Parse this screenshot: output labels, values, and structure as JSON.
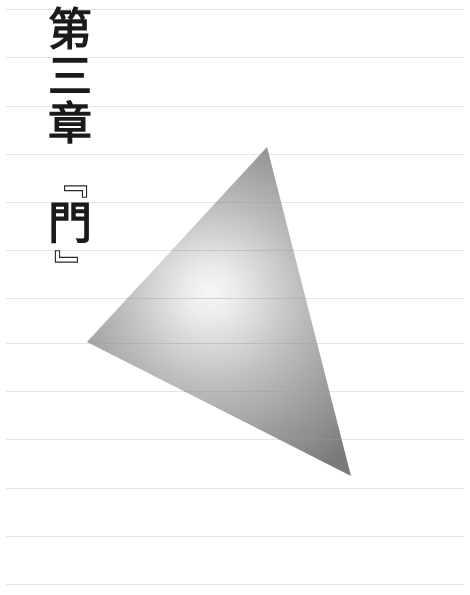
{
  "page": {
    "background": "#ffffff",
    "rule_color": "#e4e4e4",
    "rule_spacing_px": 48.3,
    "rule_positions_y": [
      9,
      57,
      106,
      154,
      202,
      250,
      298,
      343,
      391,
      439,
      488,
      536,
      584
    ]
  },
  "chapter": {
    "number_label": [
      "第",
      "三",
      "章"
    ],
    "open_bracket": "『",
    "title": "門",
    "close_bracket": "』",
    "text_color": "#1a1a1a"
  },
  "illustration": {
    "shape": "triangle",
    "vertices": [
      [
        267,
        147
      ],
      [
        87,
        342
      ],
      [
        351,
        476
      ]
    ],
    "gradient": {
      "type": "radial",
      "center": [
        215,
        300
      ],
      "inner_color": "#f6f6f6",
      "mid_color": "#bdbdbd",
      "outer_color": "#7a7a7a"
    }
  }
}
